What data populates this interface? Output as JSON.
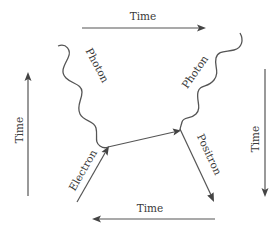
{
  "diagram": {
    "type": "feynman-diagram",
    "time_arrows": {
      "top": {
        "label": "Time",
        "direction": "right"
      },
      "bottom": {
        "label": "Time",
        "direction": "left"
      },
      "left": {
        "label": "Time",
        "direction": "up"
      },
      "right": {
        "label": "Time",
        "direction": "down"
      }
    },
    "particles": {
      "photon_left": {
        "label": "Photon"
      },
      "photon_right": {
        "label": "Photon"
      },
      "electron": {
        "label": "Electron"
      },
      "positron": {
        "label": "Positron"
      }
    },
    "colors": {
      "line": "#555555",
      "text": "#3a3a3a",
      "background": "#ffffff"
    }
  }
}
